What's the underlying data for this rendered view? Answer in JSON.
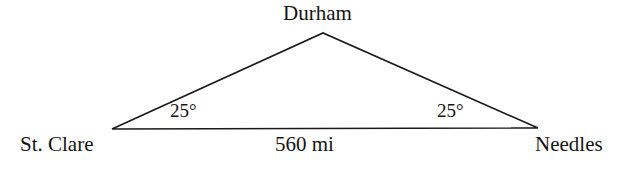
{
  "figure": {
    "type": "triangle-diagram",
    "width": 628,
    "height": 170,
    "background_color": "#ffffff",
    "stroke_color": "#1a1a1a",
    "stroke_width": 1.6
  },
  "vertices": {
    "apex": {
      "label": "Durham",
      "x": 323,
      "y": 33
    },
    "left": {
      "label": "St. Clare",
      "x": 112,
      "y": 129
    },
    "right": {
      "label": "Needles",
      "x": 538,
      "y": 128
    }
  },
  "sides": {
    "base": {
      "label": "560 mi",
      "value": 560,
      "unit": "mi"
    }
  },
  "angles": {
    "left": {
      "label": "25°",
      "value": 25,
      "unit": "degrees"
    },
    "right": {
      "label": "25°",
      "value": 25,
      "unit": "degrees"
    }
  }
}
